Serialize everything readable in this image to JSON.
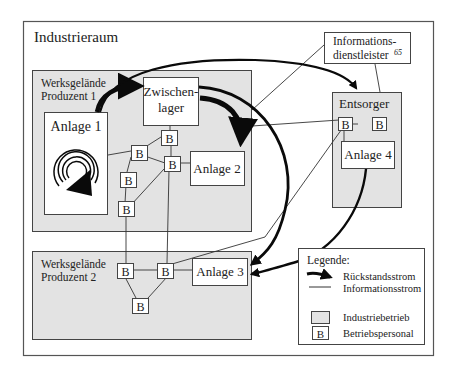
{
  "diagram": {
    "title": "Industrieraum",
    "colors": {
      "industriebetrieb_fill": "#e3e3e3",
      "box_stroke": "#444444",
      "outer_stroke": "#555555",
      "arrow": "#0a0a0a",
      "line": "#333333"
    },
    "regions": {
      "producer1": {
        "line1": "Werksgelände",
        "line2": "Produzent 1"
      },
      "producer2": {
        "line1": "Werksgelände",
        "line2": "Produzent 2"
      },
      "disposer": {
        "label": "Entsorger"
      }
    },
    "nodes": {
      "anlage1": "Anlage 1",
      "anlage2": "Anlage 2",
      "anlage3": "Anlage 3",
      "anlage4": "Anlage 4",
      "zwischenlager_line1": "Zwischen-",
      "zwischenlager_line2": "lager",
      "info_line1": "Informations-",
      "info_line2": "dienstleister",
      "info_footnote": "65",
      "personnel": "B"
    },
    "legend": {
      "title": "Legende:",
      "items": [
        {
          "symbol": "thick-arrow",
          "label": "Rückstandsstrom"
        },
        {
          "symbol": "thin-line",
          "label": "Informationsstrom"
        },
        {
          "symbol": "gray-box",
          "label": "Industriebetrieb"
        },
        {
          "symbol": "b-box",
          "label": "Betriebspersonal"
        }
      ]
    }
  }
}
